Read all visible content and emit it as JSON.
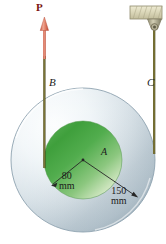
{
  "figure": {
    "labels": {
      "force": "P",
      "cord_b": "B",
      "cord_c": "C",
      "center": "A"
    },
    "dimensions": [
      {
        "name": "inner-radius",
        "value": "80",
        "unit": "mm"
      },
      {
        "name": "outer-radius",
        "value": "150",
        "unit": "mm"
      }
    ],
    "colors": {
      "force_arrow": "#d9604c",
      "cord": "#6f6a2c",
      "inner_disk_dark": "#3f9b3f",
      "inner_disk_light": "#e8f3e0",
      "outer_disk_dark": "#9fb2bd",
      "outer_disk_light": "#f2f7fa",
      "support_block": "#d8d6b8",
      "leader_line": "#2a2a2a"
    },
    "icons": {
      "force_arrow": "up-arrow-icon",
      "ceiling_support": "ceiling-support-icon",
      "eye_bolt": "eye-bolt-icon"
    }
  }
}
